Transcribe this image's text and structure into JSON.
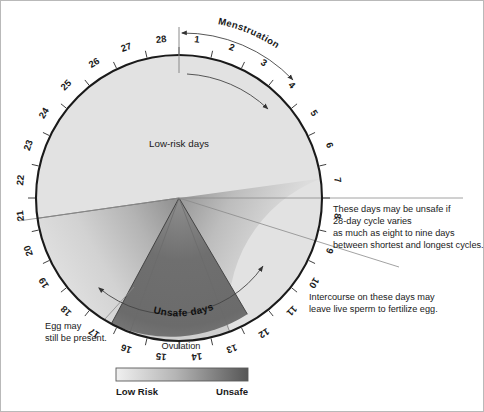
{
  "chart_data": {
    "type": "pie",
    "subtitle": "28-day cycle risk zones",
    "categories": [
      "Low-risk days",
      "Transition",
      "Unsafe days"
    ],
    "values": [
      20,
      3,
      5
    ],
    "axis": {
      "type": "day-of-cycle",
      "total_days": 28,
      "tick_labels": [
        "1",
        "2",
        "3",
        "4",
        "5",
        "6",
        "7",
        "8",
        "9",
        "10",
        "11",
        "12",
        "13",
        "14",
        "15",
        "16",
        "17",
        "18",
        "19",
        "20",
        "21",
        "22",
        "23",
        "24",
        "25",
        "26",
        "27",
        "28"
      ],
      "direction": "clockwise",
      "start_day_at_top": 1
    },
    "zones": [
      {
        "name": "Low-risk days",
        "day_start": 21,
        "day_end": 7,
        "color": "#e2e2e2"
      },
      {
        "name": "Unsafe days",
        "day_start": 11,
        "day_end": 18,
        "color": "#6e6e6e"
      }
    ],
    "legend": {
      "type": "gradient-bar",
      "low_label": "Low Risk",
      "high_label": "Unsafe",
      "low_color": "#eeeeee",
      "high_color": "#555555",
      "position": "bottom-center"
    },
    "annotations": [
      {
        "text": "Menstruation",
        "day_start": 1,
        "day_end": 5
      },
      {
        "text": "Ovulation",
        "day": 14.5
      },
      {
        "text": "Low-risk days",
        "position": "upper-interior"
      },
      {
        "text": "Unsafe days",
        "position": "lower-interior"
      }
    ]
  },
  "diagram": {
    "days": [
      "1",
      "2",
      "3",
      "4",
      "5",
      "6",
      "7",
      "8",
      "9",
      "10",
      "11",
      "12",
      "13",
      "14",
      "15",
      "16",
      "17",
      "18",
      "19",
      "20",
      "21",
      "22",
      "23",
      "24",
      "25",
      "26",
      "27",
      "28"
    ],
    "interior_labels": {
      "low_risk": "Low-risk days",
      "unsafe": "Unsafe days"
    },
    "arc_labels": {
      "menstruation": "Menstruation"
    },
    "axis_labels": {
      "ovulation": "Ovulation"
    }
  },
  "notes": {
    "right_top": [
      "These days may be unsafe if",
      "28-day cycle varies",
      "as much as eight to nine days",
      "between shortest and longest cycles."
    ],
    "right_bottom": [
      "Intercourse on these days may",
      "leave live sperm to fertilize egg."
    ],
    "left_bottom": [
      "Egg may",
      "still be present."
    ]
  },
  "legend": {
    "low_label": "Low Risk",
    "high_label": "Unsafe"
  },
  "colors": {
    "low_risk": "#e2e2e2",
    "unsafe_core": "#6e6e6e",
    "mid": "#b9b9b9",
    "outline": "#1a1a1a",
    "thin_rule": "#8a8a8a",
    "page_border": "#b9b9b9"
  }
}
